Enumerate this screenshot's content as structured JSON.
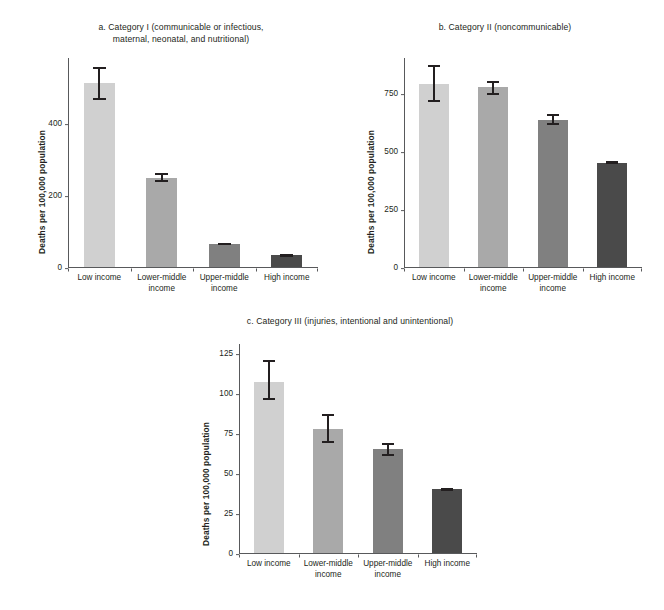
{
  "figure": {
    "background_color": "#ffffff",
    "axis_color": "#58595b",
    "text_color": "#231f20",
    "ylabel": "Deaths per 100,000 population",
    "bar_colors": [
      "#d0d0d0",
      "#a9a9a9",
      "#808080",
      "#4a4a4a"
    ]
  },
  "chart_data": [
    {
      "type": "bar",
      "panel": "a",
      "title": "a. Category I (communicable or infectious,\nmaternal, neonatal, and nutritional)",
      "categories": [
        "Low income",
        "Lower-middle\nincome",
        "Upper-middle\nincome",
        "High income"
      ],
      "categories_flat": [
        "Low income",
        "Lower-middle income",
        "Upper-middle income",
        "High income"
      ],
      "values": [
        510,
        247,
        65,
        32
      ],
      "errors_low": [
        463,
        236,
        62,
        29
      ],
      "errors_high": [
        555,
        260,
        68,
        35
      ],
      "xlabel": "",
      "ylabel": "Deaths per 100,000 population",
      "ylim": [
        0,
        580
      ],
      "yticks": [
        0,
        200,
        400
      ],
      "ytick_labels": [
        "0",
        "200",
        "400"
      ],
      "grid": false,
      "legend": "none"
    },
    {
      "type": "bar",
      "panel": "b",
      "title": "b. Category II (noncommunicable)",
      "categories": [
        "Low income",
        "Lower-middle\nincome",
        "Upper-middle\nincome",
        "High income"
      ],
      "categories_flat": [
        "Low income",
        "Lower-middle income",
        "Upper-middle income",
        "High income"
      ],
      "values": [
        790,
        775,
        635,
        450
      ],
      "errors_low": [
        712,
        742,
        612,
        444
      ],
      "errors_high": [
        868,
        800,
        660,
        456
      ],
      "xlabel": "",
      "ylabel": "Deaths per 100,000 population",
      "ylim": [
        0,
        900
      ],
      "yticks": [
        0,
        250,
        500,
        750
      ],
      "ytick_labels": [
        "0",
        "250",
        "500",
        "750"
      ],
      "grid": false,
      "legend": "none"
    },
    {
      "type": "bar",
      "panel": "c",
      "title": "c. Category III (injuries, intentional and unintentional)",
      "categories": [
        "Low income",
        "Lower-middle\nincome",
        "Upper-middle\nincome",
        "High income"
      ],
      "categories_flat": [
        "Low income",
        "Lower-middle income",
        "Upper-middle income",
        "High income"
      ],
      "values": [
        107,
        78,
        65,
        40
      ],
      "errors_low": [
        96,
        69,
        61,
        39
      ],
      "errors_high": [
        121,
        87,
        69,
        41
      ],
      "xlabel": "",
      "ylabel": "Deaths per 100,000 population",
      "ylim": [
        0,
        131
      ],
      "yticks": [
        0,
        25,
        50,
        75,
        100,
        125
      ],
      "ytick_labels": [
        "0",
        "25",
        "50",
        "75",
        "100",
        "125"
      ],
      "grid": false,
      "legend": "none"
    }
  ]
}
